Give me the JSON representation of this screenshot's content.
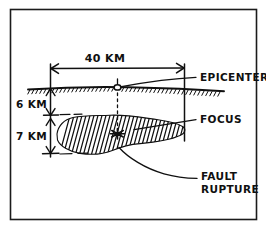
{
  "figure": {
    "style": "hand-drawn ink sketch",
    "border": {
      "name": "outer-frame",
      "color": "#1b1b1b"
    },
    "colors": {
      "ink": "#101010",
      "background": "#ffffff",
      "frame": "#1b1b1b"
    }
  },
  "dimensions": {
    "horizontal": {
      "label": "40 KM",
      "value": 40,
      "unit": "KM",
      "from": "left-reference-line",
      "to": "right-reference-line"
    },
    "vertical_upper": {
      "label": "6 KM",
      "value": 6,
      "unit": "KM",
      "from": "ground-surface",
      "to": "fault-zone-top"
    },
    "vertical_lower": {
      "label": "7 KM",
      "value": 7,
      "unit": "KM",
      "from": "fault-zone-top",
      "to": "fault-zone-bottom"
    }
  },
  "annotations": [
    {
      "id": "epicenter",
      "label": "EPICENTER",
      "marker": "small-circle-on-surface",
      "leader": "curved-line-up-right"
    },
    {
      "id": "focus",
      "label": "FOCUS",
      "marker": "star-burst",
      "leader": "straight-line-right"
    },
    {
      "id": "fault-rupture",
      "label_line1": "FAULT",
      "label_line2": "RUPTURE",
      "marker": "hatched-zone",
      "leader": "long-curved-line-down-right"
    }
  ],
  "features": {
    "ground_surface": {
      "name": "ground-surface-line",
      "description": "hand-drawn horizontal line with hatch ticks below"
    },
    "fault_zone": {
      "name": "fault-rupture-zone",
      "description": "irregular blob with dense diagonal hatching"
    },
    "center_line": {
      "name": "center-dashed-line",
      "description": "dashed vertical line from epicenter to focus"
    }
  }
}
